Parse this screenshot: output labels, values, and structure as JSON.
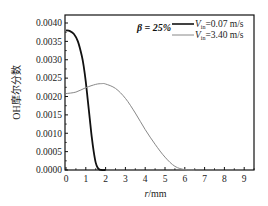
{
  "chart_data": {
    "type": "line",
    "title": "",
    "annotation": "β = 25%",
    "xlabel": "r/mm",
    "ylabel": "OH摩尔分数",
    "xlim": [
      0,
      9.5
    ],
    "ylim": [
      0,
      0.0042
    ],
    "xticks": [
      "0",
      "1",
      "2",
      "3",
      "4",
      "5",
      "6",
      "7",
      "8",
      "9"
    ],
    "yticks": [
      "0.0000",
      "0.0005",
      "0.0010",
      "0.0015",
      "0.0020",
      "0.0025",
      "0.0030",
      "0.0035",
      "0.0040"
    ],
    "grid": false,
    "legend_position": "top-right",
    "series": [
      {
        "name": "Vin=0.07 m/s",
        "color": "#111111",
        "x": [
          0,
          0.2,
          0.4,
          0.6,
          0.8,
          0.9,
          1.0,
          1.1,
          1.2,
          1.3,
          1.4,
          1.5,
          1.6,
          1.7,
          1.8,
          2.0
        ],
        "y": [
          0.0038,
          0.00378,
          0.0037,
          0.0035,
          0.0031,
          0.0028,
          0.0024,
          0.0019,
          0.0014,
          0.0009,
          0.0005,
          0.0002,
          6e-05,
          1e-05,
          0.0,
          0.0
        ]
      },
      {
        "name": "Vin=3.40 m/s",
        "color": "#888888",
        "x": [
          0,
          0.5,
          1.0,
          1.5,
          1.8,
          2.0,
          2.5,
          3.0,
          3.5,
          4.0,
          4.5,
          5.0,
          5.5,
          6.0,
          6.5
        ],
        "y": [
          0.00208,
          0.00212,
          0.00224,
          0.00233,
          0.00235,
          0.00234,
          0.00222,
          0.00195,
          0.00155,
          0.0011,
          0.0007,
          0.00035,
          0.0001,
          1e-05,
          0.0
        ]
      }
    ]
  },
  "legend": {
    "items": [
      {
        "prefix": "V",
        "sub": "in",
        "suffix": "=0.07 m/s"
      },
      {
        "prefix": "V",
        "sub": "in",
        "suffix": "=3.40 m/s"
      }
    ]
  }
}
